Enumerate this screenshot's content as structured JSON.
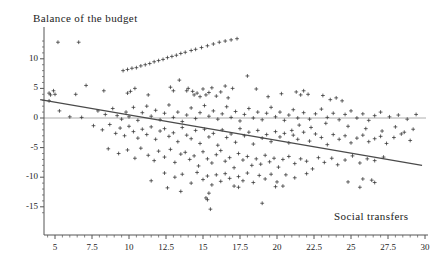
{
  "chart_data": {
    "type": "scatter",
    "title": "",
    "xlabel": "Social transfers",
    "ylabel": "Balance of the budget",
    "xlim": [
      3.8,
      30.4
    ],
    "ylim": [
      -17.0,
      13.8
    ],
    "grid": false,
    "legend": null,
    "marker": "plus",
    "marker_color": "#333333",
    "line_color": "#4a4a4a",
    "axis_color": "#555555",
    "zero_line_color": "#9a9a9a",
    "xticks": [
      5,
      7.5,
      10,
      12.5,
      15,
      17.5,
      20,
      22.5,
      25,
      27.5,
      30
    ],
    "xtick_labels": [
      "5",
      "7.5",
      "10",
      "12.5",
      "15",
      "17.5",
      "20",
      "22.5",
      "25",
      "27.5",
      "30"
    ],
    "yticks": [
      10,
      5,
      0,
      -5,
      -10,
      -15
    ],
    "ytick_labels": [
      "10",
      "5",
      "0",
      "-5",
      "-10",
      "-15"
    ],
    "zero_line": 0,
    "regression_line": {
      "x_start": 4.0,
      "y_start": 3.1,
      "x_end": 29.8,
      "y_end": -8.0,
      "slope": -0.43,
      "intercept": 4.82
    },
    "points": [
      [
        5.2,
        12.8
      ],
      [
        6.6,
        12.8
      ],
      [
        9.6,
        8.0
      ],
      [
        9.9,
        8.2
      ],
      [
        10.2,
        8.4
      ],
      [
        10.5,
        8.5
      ],
      [
        10.8,
        8.8
      ],
      [
        11.1,
        9.0
      ],
      [
        11.4,
        9.2
      ],
      [
        11.7,
        9.5
      ],
      [
        12.0,
        9.7
      ],
      [
        12.3,
        9.9
      ],
      [
        12.6,
        10.2
      ],
      [
        12.9,
        10.4
      ],
      [
        13.2,
        10.6
      ],
      [
        13.5,
        10.9
      ],
      [
        13.8,
        11.1
      ],
      [
        14.2,
        11.4
      ],
      [
        14.5,
        11.6
      ],
      [
        14.9,
        11.9
      ],
      [
        15.3,
        12.2
      ],
      [
        15.7,
        12.5
      ],
      [
        16.1,
        12.8
      ],
      [
        16.5,
        13.0
      ],
      [
        16.9,
        13.2
      ],
      [
        17.3,
        13.4
      ],
      [
        4.6,
        4.2
      ],
      [
        4.7,
        3.9
      ],
      [
        4.9,
        4.6
      ],
      [
        5.0,
        4.0
      ],
      [
        6.4,
        4.0
      ],
      [
        7.1,
        5.5
      ],
      [
        8.3,
        4.6
      ],
      [
        9.9,
        4.2
      ],
      [
        10.1,
        4.5
      ],
      [
        10.4,
        5.0
      ],
      [
        11.3,
        3.9
      ],
      [
        12.8,
        5.2
      ],
      [
        13.0,
        4.6
      ],
      [
        13.4,
        6.4
      ],
      [
        13.9,
        4.6
      ],
      [
        14.0,
        5.0
      ],
      [
        14.3,
        4.5
      ],
      [
        14.4,
        3.9
      ],
      [
        14.6,
        4.2
      ],
      [
        14.8,
        3.6
      ],
      [
        15.0,
        4.9
      ],
      [
        15.2,
        3.9
      ],
      [
        15.4,
        4.3
      ],
      [
        15.6,
        5.1
      ],
      [
        15.9,
        3.7
      ],
      [
        16.2,
        4.4
      ],
      [
        16.5,
        5.4
      ],
      [
        16.7,
        3.4
      ],
      [
        17.0,
        5.0
      ],
      [
        18.0,
        7.1
      ],
      [
        18.6,
        4.9
      ],
      [
        19.4,
        3.6
      ],
      [
        20.3,
        4.1
      ],
      [
        21.3,
        4.4
      ],
      [
        21.6,
        3.9
      ],
      [
        21.8,
        4.6
      ],
      [
        22.1,
        4.0
      ],
      [
        23.1,
        3.8
      ],
      [
        23.6,
        3.1
      ],
      [
        24.0,
        3.4
      ],
      [
        24.4,
        2.9
      ],
      [
        4.6,
        2.9
      ],
      [
        5.3,
        1.2
      ],
      [
        6.0,
        0.2
      ],
      [
        6.8,
        0.1
      ],
      [
        7.9,
        1.2
      ],
      [
        8.4,
        0.6
      ],
      [
        8.9,
        1.6
      ],
      [
        9.2,
        0.4
      ],
      [
        9.5,
        -0.2
      ],
      [
        9.8,
        1.0
      ],
      [
        10.0,
        0.2
      ],
      [
        10.3,
        1.8
      ],
      [
        10.6,
        -0.4
      ],
      [
        10.9,
        0.9
      ],
      [
        11.2,
        2.0
      ],
      [
        11.5,
        0.3
      ],
      [
        11.8,
        1.3
      ],
      [
        12.1,
        -0.3
      ],
      [
        12.4,
        0.8
      ],
      [
        12.7,
        2.2
      ],
      [
        13.0,
        0.1
      ],
      [
        13.3,
        1.0
      ],
      [
        13.6,
        -0.6
      ],
      [
        13.9,
        0.5
      ],
      [
        14.2,
        1.7
      ],
      [
        14.5,
        -0.1
      ],
      [
        14.8,
        0.9
      ],
      [
        15.1,
        2.1
      ],
      [
        15.4,
        0.3
      ],
      [
        15.7,
        1.2
      ],
      [
        16.0,
        -0.2
      ],
      [
        16.3,
        0.7
      ],
      [
        16.6,
        1.9
      ],
      [
        16.9,
        0.1
      ],
      [
        17.2,
        1.1
      ],
      [
        17.5,
        -0.5
      ],
      [
        17.8,
        0.6
      ],
      [
        18.1,
        1.6
      ],
      [
        18.4,
        0.0
      ],
      [
        18.7,
        1.0
      ],
      [
        19.0,
        -0.3
      ],
      [
        19.3,
        0.8
      ],
      [
        19.6,
        1.8
      ],
      [
        19.9,
        0.2
      ],
      [
        20.2,
        1.0
      ],
      [
        20.5,
        -0.4
      ],
      [
        20.8,
        0.5
      ],
      [
        21.1,
        1.4
      ],
      [
        21.4,
        0.0
      ],
      [
        21.8,
        0.9
      ],
      [
        22.2,
        -0.2
      ],
      [
        22.6,
        0.7
      ],
      [
        23.0,
        1.5
      ],
      [
        23.4,
        0.1
      ],
      [
        23.8,
        0.8
      ],
      [
        24.2,
        -0.3
      ],
      [
        24.6,
        0.6
      ],
      [
        25.0,
        1.2
      ],
      [
        25.4,
        0.0
      ],
      [
        25.8,
        0.7
      ],
      [
        26.2,
        -0.4
      ],
      [
        26.6,
        0.4
      ],
      [
        27.0,
        1.0
      ],
      [
        27.6,
        0.2
      ],
      [
        28.2,
        0.5
      ],
      [
        28.8,
        -0.2
      ],
      [
        29.4,
        0.6
      ],
      [
        7.6,
        -1.3
      ],
      [
        8.2,
        -2.0
      ],
      [
        8.7,
        -1.1
      ],
      [
        9.1,
        -2.6
      ],
      [
        9.4,
        -1.7
      ],
      [
        9.7,
        -3.0
      ],
      [
        10.0,
        -1.4
      ],
      [
        10.3,
        -2.3
      ],
      [
        10.6,
        -3.4
      ],
      [
        10.9,
        -1.9
      ],
      [
        11.2,
        -2.8
      ],
      [
        11.5,
        -1.5
      ],
      [
        11.8,
        -3.6
      ],
      [
        12.1,
        -2.2
      ],
      [
        12.4,
        -1.8
      ],
      [
        12.7,
        -3.1
      ],
      [
        13.0,
        -2.5
      ],
      [
        13.3,
        -4.0
      ],
      [
        13.6,
        -1.6
      ],
      [
        13.9,
        -2.9
      ],
      [
        14.2,
        -3.5
      ],
      [
        14.5,
        -2.1
      ],
      [
        14.8,
        -4.3
      ],
      [
        15.1,
        -1.9
      ],
      [
        15.4,
        -3.2
      ],
      [
        15.7,
        -2.6
      ],
      [
        16.0,
        -4.6
      ],
      [
        16.3,
        -2.0
      ],
      [
        16.6,
        -3.3
      ],
      [
        16.9,
        -2.7
      ],
      [
        17.2,
        -4.1
      ],
      [
        17.5,
        -1.8
      ],
      [
        17.8,
        -3.0
      ],
      [
        18.1,
        -2.4
      ],
      [
        18.4,
        -4.4
      ],
      [
        18.7,
        -2.1
      ],
      [
        19.0,
        -3.4
      ],
      [
        19.3,
        -2.8
      ],
      [
        19.6,
        -4.0
      ],
      [
        19.9,
        -2.3
      ],
      [
        20.2,
        -3.2
      ],
      [
        20.5,
        -2.6
      ],
      [
        20.8,
        -4.2
      ],
      [
        21.1,
        -2.9
      ],
      [
        21.4,
        -3.6
      ],
      [
        21.8,
        -2.4
      ],
      [
        22.2,
        -3.9
      ],
      [
        22.6,
        -2.7
      ],
      [
        23.0,
        -3.3
      ],
      [
        23.4,
        -4.5
      ],
      [
        23.8,
        -2.8
      ],
      [
        24.2,
        -3.6
      ],
      [
        24.6,
        -3.0
      ],
      [
        25.0,
        -4.2
      ],
      [
        25.4,
        -3.4
      ],
      [
        25.8,
        -2.9
      ],
      [
        26.2,
        -4.0
      ],
      [
        26.6,
        -3.5
      ],
      [
        27.0,
        -3.1
      ],
      [
        27.4,
        -4.3
      ],
      [
        27.9,
        -3.3
      ],
      [
        28.4,
        -2.7
      ],
      [
        29.0,
        -3.8
      ],
      [
        8.6,
        -5.2
      ],
      [
        9.3,
        -6.0
      ],
      [
        9.9,
        -5.4
      ],
      [
        10.4,
        -6.8
      ],
      [
        10.8,
        -5.1
      ],
      [
        11.3,
        -6.3
      ],
      [
        11.7,
        -7.2
      ],
      [
        12.0,
        -5.6
      ],
      [
        12.4,
        -6.6
      ],
      [
        12.8,
        -5.3
      ],
      [
        13.1,
        -7.5
      ],
      [
        13.5,
        -6.1
      ],
      [
        13.8,
        -5.8
      ],
      [
        14.1,
        -7.0
      ],
      [
        14.4,
        -6.4
      ],
      [
        14.7,
        -8.1
      ],
      [
        15.0,
        -5.7
      ],
      [
        15.3,
        -6.9
      ],
      [
        15.6,
        -7.6
      ],
      [
        15.9,
        -6.2
      ],
      [
        16.2,
        -5.5
      ],
      [
        16.5,
        -7.3
      ],
      [
        16.8,
        -6.7
      ],
      [
        17.1,
        -8.4
      ],
      [
        17.4,
        -6.0
      ],
      [
        17.7,
        -7.1
      ],
      [
        18.0,
        -6.5
      ],
      [
        18.3,
        -8.0
      ],
      [
        18.6,
        -6.9
      ],
      [
        18.9,
        -7.8
      ],
      [
        19.2,
        -6.3
      ],
      [
        19.5,
        -7.4
      ],
      [
        19.8,
        -6.8
      ],
      [
        20.1,
        -8.3
      ],
      [
        20.4,
        -7.0
      ],
      [
        20.8,
        -6.5
      ],
      [
        21.2,
        -7.7
      ],
      [
        21.6,
        -6.9
      ],
      [
        22.0,
        -7.3
      ],
      [
        22.4,
        -8.6
      ],
      [
        22.8,
        -6.7
      ],
      [
        23.2,
        -7.5
      ],
      [
        23.7,
        -6.8
      ],
      [
        24.1,
        -7.9
      ],
      [
        24.6,
        -7.1
      ],
      [
        25.1,
        -6.4
      ],
      [
        25.6,
        -7.6
      ],
      [
        26.1,
        -6.9
      ],
      [
        26.6,
        -7.2
      ],
      [
        27.2,
        -6.6
      ],
      [
        12.4,
        -9.3
      ],
      [
        13.1,
        -10.0
      ],
      [
        13.6,
        -9.5
      ],
      [
        14.2,
        -11.0
      ],
      [
        14.6,
        -9.2
      ],
      [
        15.0,
        -10.4
      ],
      [
        15.3,
        -9.8
      ],
      [
        15.6,
        -11.3
      ],
      [
        15.9,
        -9.6
      ],
      [
        16.2,
        -10.7
      ],
      [
        16.5,
        -9.4
      ],
      [
        16.8,
        -10.2
      ],
      [
        17.1,
        -11.5
      ],
      [
        17.4,
        -9.9
      ],
      [
        17.7,
        -10.6
      ],
      [
        18.0,
        -9.3
      ],
      [
        18.4,
        -10.9
      ],
      [
        18.8,
        -9.7
      ],
      [
        19.2,
        -10.3
      ],
      [
        19.6,
        -9.5
      ],
      [
        20.0,
        -10.8
      ],
      [
        20.6,
        -9.6
      ],
      [
        21.2,
        -10.1
      ],
      [
        22.0,
        -9.4
      ],
      [
        11.5,
        -10.6
      ],
      [
        12.6,
        -11.8
      ],
      [
        13.5,
        -12.4
      ],
      [
        15.2,
        -13.5
      ],
      [
        15.3,
        -13.8
      ],
      [
        15.4,
        -12.7
      ],
      [
        15.5,
        -15.4
      ],
      [
        17.4,
        -11.7
      ],
      [
        19.0,
        -14.4
      ],
      [
        19.9,
        -11.6
      ],
      [
        20.4,
        -11.5
      ],
      [
        24.8,
        -10.8
      ],
      [
        25.6,
        -11.7
      ],
      [
        25.8,
        -10.3
      ],
      [
        26.4,
        -10.5
      ],
      [
        26.6,
        -10.9
      ],
      [
        21.0,
        -2.1
      ],
      [
        21.5,
        -1.2
      ],
      [
        22.3,
        -1.6
      ],
      [
        23.3,
        -0.9
      ],
      [
        24.8,
        -1.4
      ],
      [
        26.0,
        -1.8
      ],
      [
        27.1,
        -2.2
      ],
      [
        28.0,
        -1.5
      ],
      [
        28.6,
        -2.4
      ],
      [
        29.2,
        -1.9
      ]
    ]
  }
}
